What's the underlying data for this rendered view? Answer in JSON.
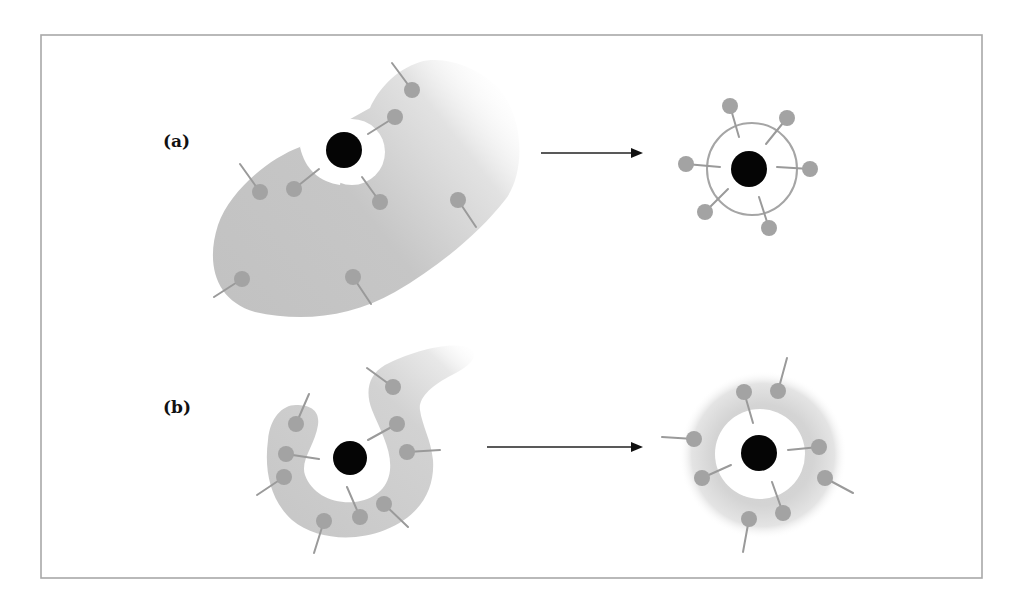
{
  "figure": {
    "panels": [
      {
        "id": "a",
        "label": "(a)",
        "before": {
          "description": "large irregular gray region (lipid/surfactant phase) with a hole containing a dark particle; amphiphilic molecules (circle heads with tails) scattered",
          "molecule_count": 8,
          "nucleus": "black-particle"
        },
        "transition": "arrow-right",
        "after": {
          "description": "dark particle enclosed by a thin single-layer ring with molecules arranged radially around it",
          "molecule_count": 6,
          "nucleus": "black-particle",
          "shell": "thin-ring"
        }
      },
      {
        "id": "b",
        "label": "(b)",
        "before": {
          "description": "curved U-shaped gray band partially wrapping a dark particle; amphiphilic molecules along the band",
          "molecule_count": 9,
          "nucleus": "black-particle"
        },
        "transition": "arrow-right",
        "after": {
          "description": "dark particle enclosed by a thick diffuse gray shell with molecules embedded around it",
          "molecule_count": 8,
          "nucleus": "black-particle",
          "shell": "thick-diffuse-shell"
        }
      }
    ],
    "colors": {
      "frame": "#a8a8a8",
      "phase_fill": "#c4c4c4",
      "molecule_head": "#a3a3a3",
      "molecule_tail": "#9a9a9a",
      "particle": "#050505",
      "arrow": "#111111"
    }
  }
}
